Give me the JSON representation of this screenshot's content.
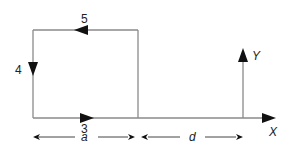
{
  "diagram": {
    "type": "current-loop-geometry",
    "colors": {
      "line": "#8a8a8a",
      "arrow": "#111111",
      "text": "#222222"
    },
    "loop": {
      "sides": [
        {
          "id": "top",
          "label": "5",
          "direction": "left"
        },
        {
          "id": "left",
          "label": "4",
          "direction": "down"
        },
        {
          "id": "bottom",
          "label": "3",
          "direction": "right"
        }
      ]
    },
    "axes": {
      "x_label": "X",
      "y_label": "Y"
    },
    "dimensions": [
      {
        "label": "a",
        "span": "loop width"
      },
      {
        "label": "d",
        "span": "loop edge to origin"
      }
    ]
  }
}
